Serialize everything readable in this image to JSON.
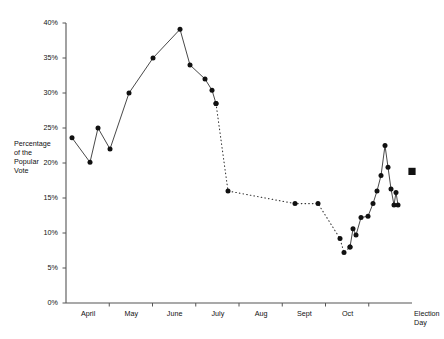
{
  "chart_data": {
    "type": "line",
    "title": "",
    "subtitle": "",
    "xlabel": "",
    "ylabel": "Percentage\nof the\nPopular\nVote",
    "ylim": [
      0,
      40
    ],
    "ytick_labels": [
      "0%",
      "5%",
      "10%",
      "15%",
      "20%",
      "25%",
      "30%",
      "35%",
      "40%"
    ],
    "ytick_values": [
      0,
      5,
      10,
      15,
      20,
      25,
      30,
      35,
      40
    ],
    "xtick_labels": [
      "April",
      "May",
      "June",
      "July",
      "Aug",
      "Sept",
      "Oct",
      "Election\nDay"
    ],
    "grid": false,
    "legend": null,
    "series": [
      {
        "name": "Primary season (solid)",
        "style": "solid",
        "marker": "circle",
        "points": [
          {
            "x": 72,
            "y": 23.6
          },
          {
            "x": 90,
            "y": 20.1
          },
          {
            "x": 98,
            "y": 25.0
          },
          {
            "x": 110,
            "y": 22.0
          },
          {
            "x": 129,
            "y": 30.0
          },
          {
            "x": 153,
            "y": 35.0
          },
          {
            "x": 180,
            "y": 39.1
          },
          {
            "x": 190,
            "y": 34.0
          },
          {
            "x": 205,
            "y": 32.0
          },
          {
            "x": 212,
            "y": 30.4
          },
          {
            "x": 216,
            "y": 28.5
          }
        ]
      },
      {
        "name": "General election season (dotted)",
        "style": "dotted",
        "marker": "circle",
        "points": [
          {
            "x": 216,
            "y": 28.5
          },
          {
            "x": 228,
            "y": 16.0
          },
          {
            "x": 295,
            "y": 14.2
          },
          {
            "x": 318,
            "y": 14.2
          },
          {
            "x": 340,
            "y": 9.2
          },
          {
            "x": 344,
            "y": 7.2
          },
          {
            "x": 350,
            "y": 8.0
          }
        ]
      },
      {
        "name": "Closing stretch (solid)",
        "style": "solid",
        "marker": "circle",
        "points": [
          {
            "x": 350,
            "y": 8.0
          },
          {
            "x": 353,
            "y": 10.6
          },
          {
            "x": 356,
            "y": 9.7
          },
          {
            "x": 361,
            "y": 12.2
          },
          {
            "x": 368,
            "y": 12.4
          },
          {
            "x": 373,
            "y": 14.2
          },
          {
            "x": 377,
            "y": 16.0
          },
          {
            "x": 381,
            "y": 18.2
          },
          {
            "x": 385,
            "y": 22.5
          },
          {
            "x": 388,
            "y": 19.4
          },
          {
            "x": 391,
            "y": 16.3
          },
          {
            "x": 394,
            "y": 14.0
          },
          {
            "x": 396,
            "y": 15.8
          },
          {
            "x": 398,
            "y": 14.0
          }
        ]
      },
      {
        "name": "Election day result",
        "style": "marker-only",
        "marker": "square",
        "points": [
          {
            "x": 412,
            "y": 18.8
          }
        ]
      }
    ]
  },
  "colors": {
    "axis": "#444444",
    "line": "#333333",
    "marker": "#111111",
    "text": "#111111",
    "background": "#ffffff"
  }
}
